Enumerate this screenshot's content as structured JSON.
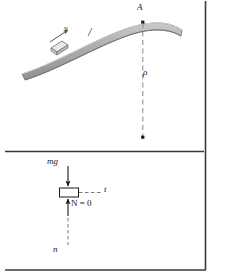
{
  "figure": {
    "colors": {
      "ramp_fill": "#a6a6a6",
      "ramp_edge": "#6e6e6e",
      "ramp_highlight": "#c9c9c9",
      "ink": "#1a1a1a",
      "dashed": "#7a7a7a",
      "block_fill": "#e8e8e8",
      "frame": "#3a3a3a",
      "background": "#ffffff"
    }
  },
  "top_panel": {
    "name": "ramp-diagram",
    "point_label": "A",
    "velocity_label": "v",
    "radius_label": "ρ",
    "description": "Block slides up a convex curved ramp toward crest point A; dashed line from A down to the center of curvature marks the radius of curvature rho."
  },
  "bottom_panel": {
    "name": "free-body-diagram",
    "weight_label": "mg",
    "tangential_axis_label": "t",
    "normal_force_label": "N = 0",
    "normal_axis_label": "n",
    "description": "Free-body diagram of the block at point A showing weight mg acting downward, normal force N equal to zero acting upward, tangential axis t horizontal and normal axis n vertical."
  }
}
